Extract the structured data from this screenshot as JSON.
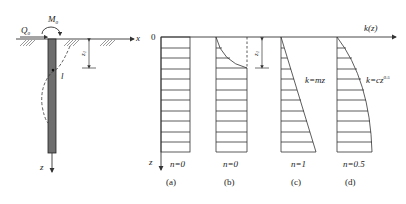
{
  "figure": {
    "left_diagram": {
      "load_shear": "Q",
      "load_shear_sub": "0",
      "load_moment": "M",
      "load_moment_sub": "0",
      "axis_x": "x",
      "axis_z": "z",
      "depth_label": "z",
      "depth_label_sub": "1",
      "pile_length_label": "l"
    },
    "right_axes": {
      "origin": "0",
      "horizontal_axis": "k(z)",
      "vertical_axis": "z",
      "depth_label": "z",
      "depth_label_sub": "1"
    },
    "panels": [
      {
        "id": "a",
        "n_label": "n=0",
        "caption": "(a)",
        "formula": ""
      },
      {
        "id": "b",
        "n_label": "n=0",
        "caption": "(b)",
        "formula": ""
      },
      {
        "id": "c",
        "n_label": "n=1",
        "caption": "(c)",
        "formula": "k=mz"
      },
      {
        "id": "d",
        "n_label": "n=0.5",
        "caption": "(d)",
        "formula_base": "k=cz",
        "formula_exp": "0.5"
      }
    ]
  },
  "colors": {
    "line": "#333333",
    "pile_fill": "#6e6e6e",
    "background": "#ffffff"
  }
}
